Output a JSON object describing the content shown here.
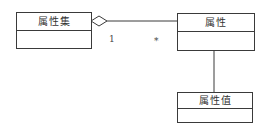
{
  "diagram": {
    "type": "uml-class",
    "classes": [
      {
        "id": "attribute-set",
        "name": "属性集"
      },
      {
        "id": "attribute",
        "name": "属性"
      },
      {
        "id": "attribute-value",
        "name": "属性值"
      }
    ],
    "relations": [
      {
        "from": "attribute-set",
        "to": "attribute",
        "kind": "aggregation",
        "from_multiplicity": "1",
        "to_multiplicity": "*"
      },
      {
        "from": "attribute",
        "to": "attribute-value",
        "kind": "association"
      }
    ],
    "line_color": "#3a3a3a"
  }
}
